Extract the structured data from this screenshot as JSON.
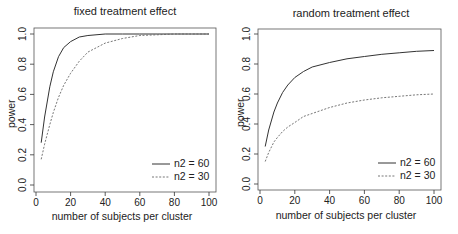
{
  "chart_data": [
    {
      "type": "line",
      "title": "fixed treatment effect",
      "xlabel": "number of subjects per cluster",
      "ylabel": "power",
      "xlim": [
        0,
        100
      ],
      "ylim": [
        0,
        1
      ],
      "x_ticks": [
        "0",
        "20",
        "40",
        "60",
        "80",
        "100"
      ],
      "y_ticks": [
        "0.0",
        "0.2",
        "0.4",
        "0.6",
        "0.8",
        "1.0"
      ],
      "grid": false,
      "legend_position": "bottom-right",
      "x": [
        3,
        5,
        8,
        10,
        13,
        16,
        20,
        25,
        30,
        40,
        50,
        60,
        70,
        80,
        90,
        100
      ],
      "series": [
        {
          "name": "n2 = 60",
          "style": "solid",
          "values": [
            0.28,
            0.45,
            0.65,
            0.75,
            0.85,
            0.91,
            0.95,
            0.98,
            0.99,
            1.0,
            1.0,
            1.0,
            1.0,
            1.0,
            1.0,
            1.0
          ]
        },
        {
          "name": "n2 = 30",
          "style": "dashed",
          "values": [
            0.17,
            0.27,
            0.4,
            0.48,
            0.58,
            0.66,
            0.74,
            0.82,
            0.88,
            0.94,
            0.97,
            0.99,
            0.995,
            1.0,
            1.0,
            1.0
          ]
        }
      ]
    },
    {
      "type": "line",
      "title": "random treatment effect",
      "xlabel": "number of subjects per cluster",
      "ylabel": "power",
      "xlim": [
        0,
        100
      ],
      "ylim": [
        0,
        1
      ],
      "x_ticks": [
        "0",
        "20",
        "40",
        "60",
        "80",
        "100"
      ],
      "y_ticks": [
        "0.0",
        "0.2",
        "0.4",
        "0.6",
        "0.8",
        "1.0"
      ],
      "grid": false,
      "legend_position": "bottom-right",
      "x": [
        3,
        5,
        8,
        10,
        13,
        16,
        20,
        25,
        30,
        40,
        50,
        60,
        70,
        80,
        90,
        100
      ],
      "series": [
        {
          "name": "n2 = 60",
          "style": "solid",
          "values": [
            0.25,
            0.36,
            0.48,
            0.54,
            0.61,
            0.66,
            0.71,
            0.75,
            0.78,
            0.81,
            0.835,
            0.85,
            0.865,
            0.875,
            0.885,
            0.89
          ]
        },
        {
          "name": "n2 = 30",
          "style": "dashed",
          "values": [
            0.15,
            0.21,
            0.28,
            0.31,
            0.35,
            0.38,
            0.41,
            0.45,
            0.47,
            0.51,
            0.54,
            0.56,
            0.575,
            0.585,
            0.595,
            0.6
          ]
        }
      ]
    }
  ],
  "panels": {
    "left": {
      "title": "fixed treatment effect",
      "xlabel": "number of subjects per cluster",
      "ylabel": "power",
      "legend": [
        "n2 = 60",
        "n2 = 30"
      ]
    },
    "right": {
      "title": "random treatment effect",
      "xlabel": "number of subjects per cluster",
      "ylabel": "power",
      "legend": [
        "n2 = 60",
        "n2 = 30"
      ]
    }
  },
  "colors": {
    "solid_line": "#333333",
    "dashed_line": "#666666",
    "axis": "#333333",
    "box": "#555555"
  }
}
